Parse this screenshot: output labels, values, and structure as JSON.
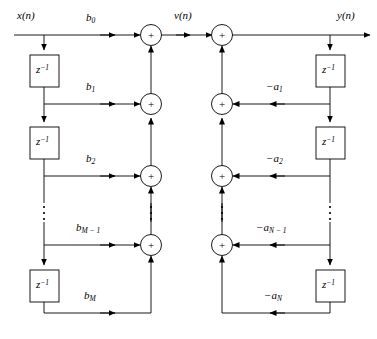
{
  "diagram": {
    "line_color": "#000000",
    "box_fill": "#ffffff",
    "signals": {
      "input": "x(n)",
      "intermediate": "v(n)",
      "output": "y(n)"
    },
    "delay_label": "z",
    "delay_exponent": "−1",
    "adder_symbol": "+",
    "vertical_ellipsis": "⋮",
    "feedforward_coefficients": [
      {
        "label": "b",
        "sub": "0",
        "text": "b0"
      },
      {
        "label": "b",
        "sub": "1",
        "text": "b1"
      },
      {
        "label": "b",
        "sub": "2",
        "text": "b2"
      },
      {
        "label": "b",
        "sub": "M − 1",
        "text": "bM-1"
      },
      {
        "label": "b",
        "sub": "M",
        "text": "bM"
      }
    ],
    "feedback_coefficients": [
      {
        "label": "−a",
        "sub": "1",
        "text": "-a1"
      },
      {
        "label": "−a",
        "sub": "2",
        "text": "-a2"
      },
      {
        "label": "−a",
        "sub": "N − 1",
        "text": "-aN-1"
      },
      {
        "label": "−a",
        "sub": "N",
        "text": "-aN"
      }
    ],
    "adder_count_left": 4,
    "adder_count_right": 4,
    "delay_count_left": 3,
    "delay_count_right": 3
  }
}
